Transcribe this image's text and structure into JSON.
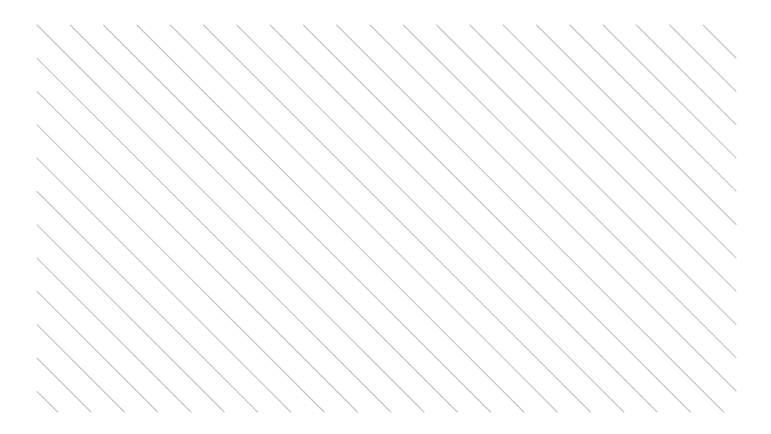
{
  "canvas": {
    "width": 771,
    "height": 434,
    "background": "#ffffff"
  },
  "hatch": {
    "region": {
      "x": 37,
      "y": 25,
      "width": 699,
      "height": 387
    },
    "direction": "top-left-to-bottom-right",
    "angle_deg": 45,
    "spacing_px": 33.3,
    "stroke_color": "#c4c4c4",
    "stroke_width": 1.1,
    "line_count": 33
  }
}
